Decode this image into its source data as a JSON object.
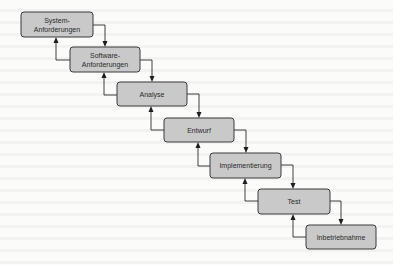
{
  "diagram": {
    "type": "waterfall-model",
    "colors": {
      "box_fill": "#c9c9c9",
      "box_stroke": "#3a3a3a",
      "text": "#2a2a2a",
      "arrow": "#2a2a2a",
      "background": "#fbfbfa"
    },
    "phases": [
      {
        "label_lines": [
          "System-",
          "Anforderungen"
        ]
      },
      {
        "label_lines": [
          "Software-",
          "Anforderungen"
        ]
      },
      {
        "label_lines": [
          "Analyse"
        ]
      },
      {
        "label_lines": [
          "Entwurf"
        ]
      },
      {
        "label_lines": [
          "Implementierung"
        ]
      },
      {
        "label_lines": [
          "Test"
        ]
      },
      {
        "label_lines": [
          "Inbetriebnahme"
        ]
      }
    ],
    "edges": [
      {
        "from": 0,
        "to": 1,
        "kind": "forward"
      },
      {
        "from": 1,
        "to": 0,
        "kind": "feedback"
      },
      {
        "from": 1,
        "to": 2,
        "kind": "forward"
      },
      {
        "from": 2,
        "to": 1,
        "kind": "feedback"
      },
      {
        "from": 2,
        "to": 3,
        "kind": "forward"
      },
      {
        "from": 3,
        "to": 2,
        "kind": "feedback"
      },
      {
        "from": 3,
        "to": 4,
        "kind": "forward"
      },
      {
        "from": 4,
        "to": 3,
        "kind": "feedback"
      },
      {
        "from": 4,
        "to": 5,
        "kind": "forward"
      },
      {
        "from": 5,
        "to": 4,
        "kind": "feedback"
      },
      {
        "from": 5,
        "to": 6,
        "kind": "forward"
      },
      {
        "from": 6,
        "to": 5,
        "kind": "feedback"
      }
    ]
  }
}
